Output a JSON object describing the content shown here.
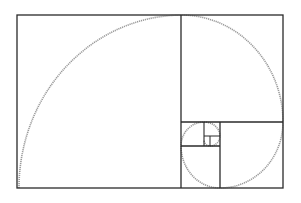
{
  "diagram": {
    "colors": {
      "background": "#ffffff",
      "line": "#2a2a2a",
      "spiral": "#9a9a9a"
    },
    "outer_rect": {
      "x": 17,
      "y": 15,
      "w": 266,
      "h": 173
    },
    "subdivision_lines": [
      {
        "x1": 181,
        "y1": 15,
        "x2": 181,
        "y2": 188
      },
      {
        "x1": 181,
        "y1": 122,
        "x2": 283,
        "y2": 122
      },
      {
        "x1": 220,
        "y1": 122,
        "x2": 220,
        "y2": 188
      },
      {
        "x1": 181,
        "y1": 146,
        "x2": 220,
        "y2": 146
      },
      {
        "x1": 204,
        "y1": 122,
        "x2": 204,
        "y2": 146
      },
      {
        "x1": 204,
        "y1": 136,
        "x2": 220,
        "y2": 136
      },
      {
        "x1": 210,
        "y1": 136,
        "x2": 210,
        "y2": 146
      }
    ]
  }
}
